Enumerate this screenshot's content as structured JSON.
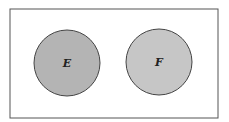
{
  "diagram": {
    "type": "venn",
    "sample_space": {
      "x": 10,
      "y": 9,
      "width": 208,
      "height": 109,
      "stroke": "#555555"
    },
    "sets": [
      {
        "label": "E",
        "cx": 67,
        "cy": 63,
        "r": 33,
        "fill": "#b4b4b4",
        "stroke": "#444444"
      },
      {
        "label": "F",
        "cx": 159,
        "cy": 62,
        "r": 33,
        "fill": "#c6c6c6",
        "stroke": "#444444"
      }
    ]
  }
}
